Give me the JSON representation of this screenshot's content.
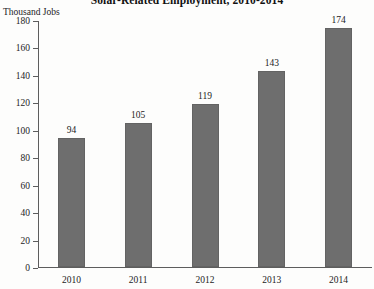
{
  "chart_data": {
    "type": "bar",
    "title": "Solar-Related Employment, 2010-2014",
    "xlabel": "",
    "ylabel": "Thousand Jobs",
    "categories": [
      "2010",
      "2011",
      "2012",
      "2013",
      "2014"
    ],
    "values": [
      94,
      105,
      119,
      143,
      174
    ],
    "value_labels": [
      "94",
      "105",
      "119",
      "143",
      "174"
    ],
    "ylim": [
      0,
      180
    ],
    "ytick_values": [
      180,
      160,
      140,
      120,
      100,
      80,
      60,
      40,
      20,
      0
    ],
    "ytick_labels": [
      "180",
      "160",
      "140",
      "120",
      "100",
      "80",
      "60",
      "40",
      "20",
      "0"
    ],
    "grid": false,
    "legend": null,
    "bar_color": "#6e6e6e",
    "axis_color": "#5d5d5d",
    "background_color": "#fdfdfc"
  }
}
